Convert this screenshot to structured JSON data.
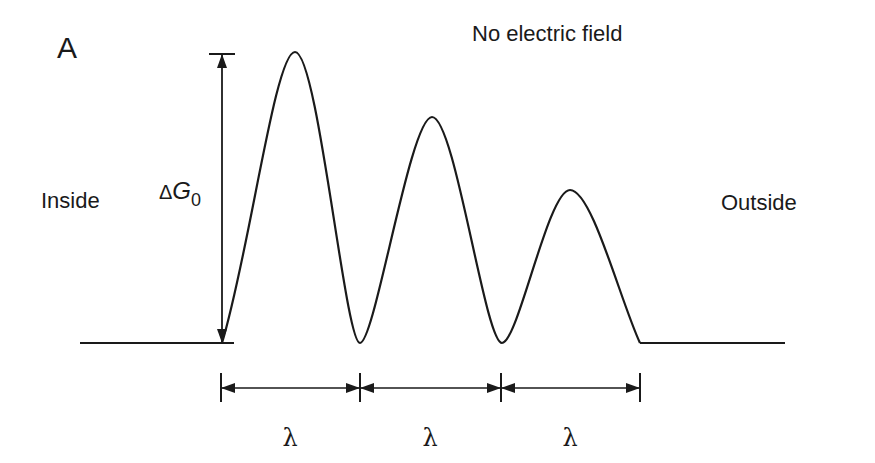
{
  "panel_label": "A",
  "title": "No electric field",
  "left_label": "Inside",
  "right_label": "Outside",
  "barrier_label": {
    "symbol": "ΔG",
    "subscript": "0"
  },
  "spacing_labels": [
    "λ",
    "λ",
    "λ"
  ],
  "colors": {
    "line": "#1a1a1a",
    "background": "#ffffff"
  },
  "diagram": {
    "baseline_y": 343,
    "barriers": [
      {
        "peak_x": 295,
        "peak_y": 52,
        "start_x": 222,
        "end_x": 360
      },
      {
        "peak_x": 432,
        "peak_y": 117,
        "start_x": 360,
        "end_x": 502
      },
      {
        "peak_x": 570,
        "peak_y": 190,
        "start_x": 502,
        "end_x": 640
      }
    ]
  }
}
